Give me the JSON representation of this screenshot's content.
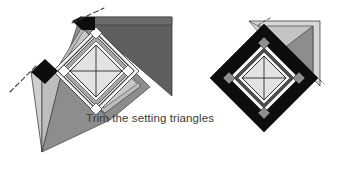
{
  "figure": {
    "title": "Trim the setting triangles",
    "caption": "Trim the setting triangles",
    "caption_label": "Trim the setting triangles",
    "background_color": "#ffffff",
    "panels": [
      {
        "id": "before",
        "name": "untrimmed-block",
        "description": "Diamond-in-a-square quilt block with oversized setting triangles extending past the block edges, dashed trim lines marked"
      },
      {
        "id": "after",
        "name": "trimmed-block",
        "description": "Same block after the setting triangles have been trimmed to a square on point with a black border"
      }
    ],
    "colors": {
      "black": "#0d0d0d",
      "dark_gray": "#5f5f5f",
      "mid_gray": "#8d8d8d",
      "light_gray": "#b9b9b9",
      "pale_gray": "#d6d6d6",
      "near_white": "#efefef",
      "white": "#ffffff",
      "outline": "#2b2b2b",
      "dash": "#3c3c3c",
      "text": "#3a3a3a"
    }
  }
}
